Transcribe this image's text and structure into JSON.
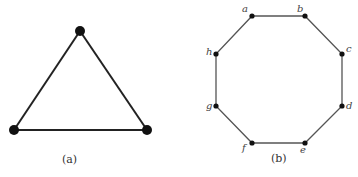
{
  "figure_a": {
    "caption": "(a)",
    "vertices": [
      {
        "id": "top",
        "x": 80,
        "y": 31
      },
      {
        "id": "bottom-left",
        "x": 14,
        "y": 130
      },
      {
        "id": "bottom-right",
        "x": 147,
        "y": 130
      }
    ],
    "edges": [
      [
        "top",
        "bottom-left"
      ],
      [
        "bottom-left",
        "bottom-right"
      ],
      [
        "bottom-right",
        "top"
      ]
    ],
    "edge_color": "#222222",
    "vertex_color": "#111111"
  },
  "figure_b": {
    "caption": "(b)",
    "vertices": [
      {
        "id": "a",
        "label": "a",
        "x": 252,
        "y": 16
      },
      {
        "id": "b",
        "label": "b",
        "x": 305,
        "y": 16
      },
      {
        "id": "c",
        "label": "c",
        "x": 342,
        "y": 54
      },
      {
        "id": "d",
        "label": "d",
        "x": 342,
        "y": 106
      },
      {
        "id": "e",
        "label": "e",
        "x": 305,
        "y": 143
      },
      {
        "id": "f",
        "label": "f",
        "x": 252,
        "y": 143
      },
      {
        "id": "g",
        "label": "g",
        "x": 216,
        "y": 106
      },
      {
        "id": "h",
        "label": "h",
        "x": 216,
        "y": 54
      }
    ],
    "edges": [
      [
        "a",
        "b"
      ],
      [
        "b",
        "c"
      ],
      [
        "c",
        "d"
      ],
      [
        "d",
        "e"
      ],
      [
        "e",
        "f"
      ],
      [
        "f",
        "g"
      ],
      [
        "g",
        "h"
      ],
      [
        "h",
        "a"
      ]
    ],
    "edge_color": "#555555",
    "vertex_color": "#111111"
  }
}
